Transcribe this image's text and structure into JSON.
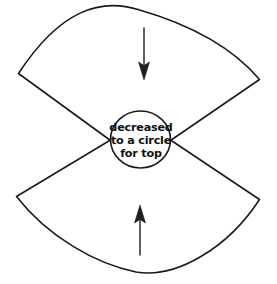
{
  "figure": {
    "background_color": "#ffffff",
    "ink_color": "#1a1a1a",
    "annotation": {
      "line1": "decreased",
      "line2": "to a circle",
      "line3": "for top"
    },
    "shapes": {
      "upper_sector_name": "upper-sector",
      "lower_sector_name": "lower-sector",
      "center_circle_name": "center-circle"
    },
    "arrows": {
      "top": {
        "name": "top-arrow",
        "direction": "down"
      },
      "bottom": {
        "name": "bottom-arrow",
        "direction": "up"
      }
    }
  }
}
